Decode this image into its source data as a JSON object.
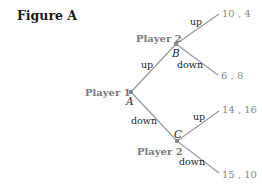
{
  "figure": {
    "title": "Figure A",
    "edge_color": "#9a9a9a",
    "node_color": "#8a8a8a",
    "nodes": {
      "A": {
        "letter": "A",
        "player": "Player 1"
      },
      "B": {
        "letter": "B",
        "player": "Player 2"
      },
      "C": {
        "letter": "C",
        "player": "Player 2"
      }
    },
    "edges": {
      "a_up": "up",
      "a_down": "down",
      "b_up": "up",
      "b_down": "down",
      "c_up": "up",
      "c_down": "down"
    },
    "payoffs": {
      "b_up": "10 , 4",
      "b_down": "6 , 8",
      "c_up": "14 , 16",
      "c_down": "15 , 10"
    }
  }
}
